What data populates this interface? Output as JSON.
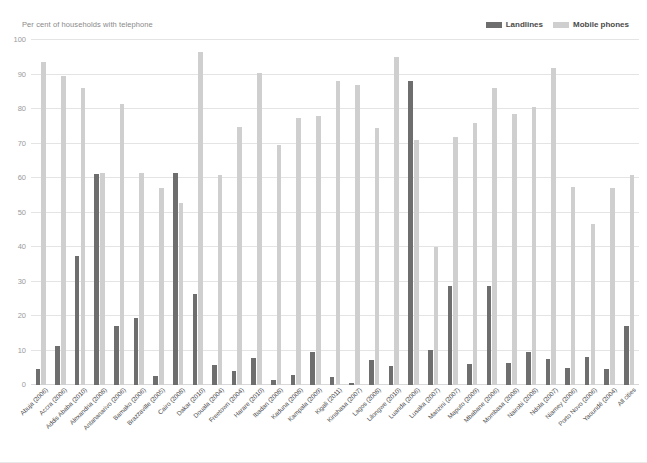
{
  "chart": {
    "title": "Per cent of households with telephone",
    "legend": [
      {
        "label": "Landlines",
        "color": "#6e6e6e",
        "name": "legend-landlines"
      },
      {
        "label": "Mobile phones",
        "color": "#cfcfcf",
        "name": "legend-mobile-phones"
      }
    ]
  },
  "chart_data": {
    "type": "bar",
    "title": "Per cent of households with telephone",
    "subtitle": "",
    "xlabel": "",
    "ylabel": "Per cent of households with telephone",
    "ylim": [
      0,
      100
    ],
    "yticks": [
      0,
      10,
      20,
      30,
      40,
      50,
      60,
      70,
      80,
      90,
      100
    ],
    "grid": true,
    "legend_position": "top-right",
    "categories": [
      "Abuja (2006)",
      "Accra (2006)",
      "Addis Ababa (2010)",
      "Alexandria (2008)",
      "Antananarivo (2006)",
      "Bamako (2006)",
      "Brazzaville (2005)",
      "Cairo (2008)",
      "Dakar (2010)",
      "Douala (2004)",
      "Freetown (2004)",
      "Harare (2010)",
      "Ibadan (2008)",
      "Kaduna (2008)",
      "Kampala (2009)",
      "Kigali (2011)",
      "Kinshasa (2007)",
      "Lagos (2008)",
      "Lilongwe (2010)",
      "Luanda (2006)",
      "Lusaka (2007)",
      "Manzini (2007)",
      "Maputo (2009)",
      "Mbabane (2006)",
      "Mombasa (2008)",
      "Nairobi (2008)",
      "Ndola (2007)",
      "Niamey (2006)",
      "Porto Novo (2006)",
      "Yaoundé (2004)",
      "All cities"
    ],
    "series": [
      {
        "name": "Landlines",
        "color": "#6e6e6e",
        "values": [
          4.5,
          11.3,
          37.5,
          61.3,
          17.0,
          19.5,
          2.7,
          61.5,
          26.3,
          5.8,
          4.0,
          7.7,
          1.4,
          3.0,
          9.7,
          2.3,
          0.6,
          7.2,
          5.6,
          88.0,
          10.2,
          28.8,
          6.0,
          28.8,
          6.4,
          9.5,
          7.4,
          5.0,
          8.2,
          4.6,
          17.0
        ]
      },
      {
        "name": "Mobile phones",
        "color": "#cfcfcf",
        "values": [
          93.5,
          89.5,
          86.0,
          61.5,
          81.5,
          61.5,
          57.0,
          52.7,
          96.5,
          60.8,
          74.8,
          90.5,
          69.5,
          77.5,
          78.0,
          88.0,
          87.0,
          74.5,
          95.0,
          71.0,
          40.0,
          72.0,
          76.0,
          86.0,
          78.5,
          80.5,
          92.0,
          57.5,
          46.8,
          57.2,
          60.8
        ]
      }
    ]
  }
}
